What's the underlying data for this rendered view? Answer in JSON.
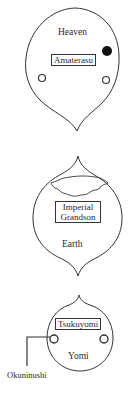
{
  "diagram": {
    "title": "",
    "realms": [
      {
        "id": "heaven",
        "label": "Heaven",
        "deity": "Amaterasu"
      },
      {
        "id": "earth",
        "label": "Earth",
        "deity_line1": "Imperial",
        "deity_line2": "Grandson"
      },
      {
        "id": "yomi",
        "label": "Yomi",
        "deity": "Tsukuyomi",
        "pointer_label": "Okuninushi"
      }
    ]
  },
  "colors": {
    "stroke": "#333333",
    "filled_dot": "#111111",
    "background": "#ffffff"
  }
}
